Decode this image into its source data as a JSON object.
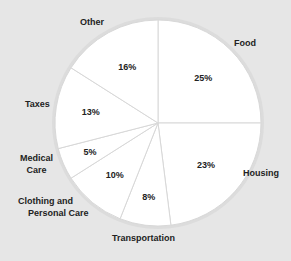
{
  "colors": {
    "background": "#e6e6e6",
    "slice_fill": "#ffffff",
    "slice_border": "#d8d8d8",
    "text": "#222222"
  },
  "chart_data": {
    "type": "pie",
    "title": "",
    "start_angle": "12 o'clock",
    "direction": "clockwise",
    "categories": [
      "Food",
      "Housing",
      "Transportation",
      "Clothing and Personal Care",
      "Medical Care",
      "Taxes",
      "Other"
    ],
    "values": [
      25,
      23,
      8,
      10,
      5,
      13,
      16
    ],
    "value_labels": [
      "25%",
      "23%",
      "8%",
      "10%",
      "5%",
      "13%",
      "16%"
    ],
    "unit": "%",
    "legend": "none (labels placed outside slices)"
  },
  "labels": {
    "food": "Food",
    "housing": "Housing",
    "transportation": "Transportation",
    "clothing_line1": "Clothing and",
    "clothing_line2": "Personal Care",
    "medical_line1": "Medical",
    "medical_line2": "Care",
    "taxes": "Taxes",
    "other": "Other"
  }
}
